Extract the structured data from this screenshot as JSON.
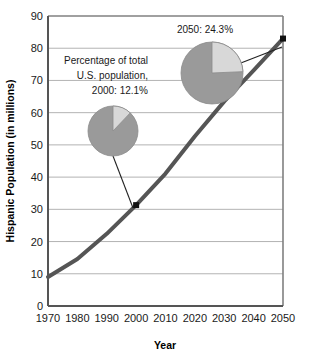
{
  "chart_data": {
    "type": "line",
    "title": "",
    "xlabel": "Year",
    "ylabel": "Hispanic Population (in millions)",
    "xlim": [
      1970,
      2050
    ],
    "ylim": [
      0,
      90
    ],
    "grid": true,
    "legend": "none",
    "x_ticks": [
      "1970",
      "1980",
      "1990",
      "2000",
      "2010",
      "2020",
      "2030",
      "2040",
      "2050"
    ],
    "y_ticks": [
      "0",
      "10",
      "20",
      "30",
      "40",
      "50",
      "60",
      "70",
      "80",
      "90"
    ],
    "x": [
      1970,
      1980,
      1990,
      2000,
      2010,
      2020,
      2030,
      2040,
      2050
    ],
    "series": [
      {
        "name": "Hispanic Population (in millions)",
        "values": [
          9,
          14.6,
          22.4,
          31.3,
          41.1,
          52.7,
          63.5,
          73.1,
          83
        ]
      }
    ],
    "markers": [
      {
        "name": "marker-2000",
        "x": 2000,
        "y": 31.3
      },
      {
        "name": "marker-2050",
        "x": 2050,
        "y": 83
      }
    ],
    "annotations": [
      {
        "name": "annotation-2000",
        "lines": [
          "Percentage of total",
          "U.S. population,",
          "2000: 12.1%"
        ],
        "pie": {
          "name": "pie-2000",
          "label": "2000",
          "share_percent": 12.1,
          "rest_percent": 87.9
        }
      },
      {
        "name": "annotation-2050",
        "lines": [
          "2050: 24.3%"
        ],
        "pie": {
          "name": "pie-2050",
          "label": "2050",
          "share_percent": 24.3,
          "rest_percent": 75.7
        }
      }
    ],
    "colors": {
      "line": "#555555",
      "marker": "#111111",
      "grid": "#aaaaaa",
      "frame": "#808080",
      "pie_share": "#d8d8d8",
      "pie_rest": "#9a9a9a",
      "pie_edge": "#8a8a8a",
      "leader": "#222222",
      "plot_background": "#ffffff"
    }
  }
}
